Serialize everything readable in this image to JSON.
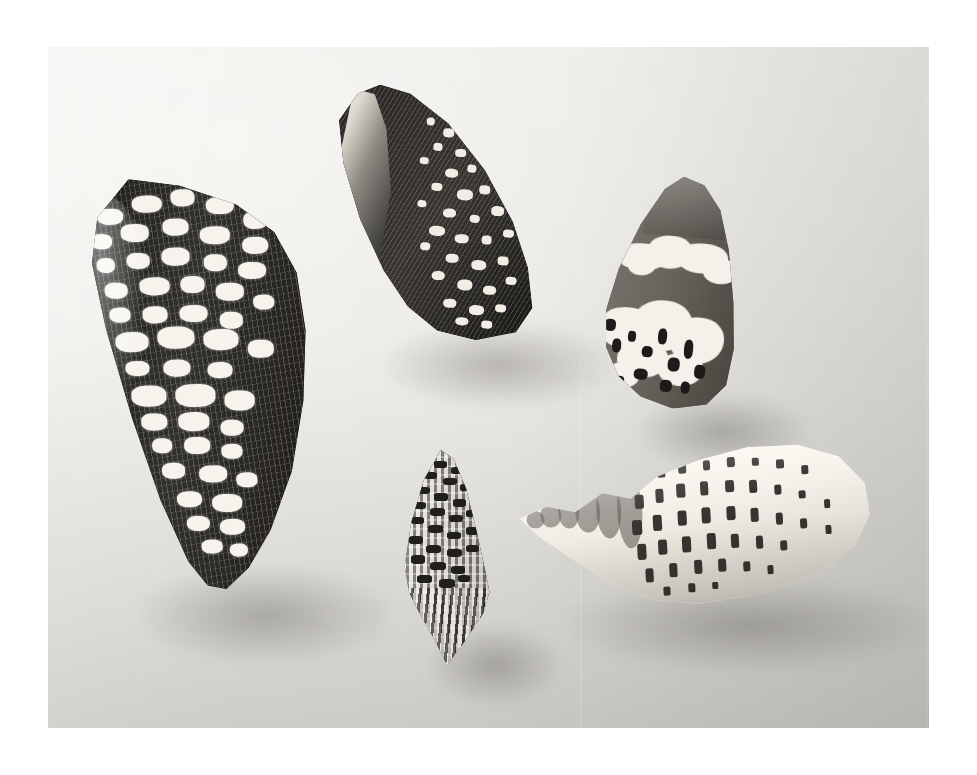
{
  "photograph": {
    "kind": "black-and-white-photograph",
    "subject": "five cone shells (Conidae) arranged on a plain light background",
    "orientation": "landscape",
    "border": {
      "color": "#ffffff",
      "left_px": 48,
      "top_px": 47,
      "right_px": 48,
      "bottom_px": 47
    },
    "print": {
      "width_px": 881,
      "height_px": 681,
      "background_color": "#e9e8e4",
      "highlight_color": "#f3f2ee",
      "shadow_color": "#d3d1cb",
      "lighting": "soft light from upper-left, shading toward lower-right"
    },
    "palette": {
      "paper_white": "#ffffff",
      "print_light": "#f3f2ee",
      "print_mid": "#e2e0db",
      "print_dark": "#d0cdc7",
      "shell_white": "#f1efe9",
      "shell_mid_gray": "#6e6b64",
      "shell_dark": "#211f1d",
      "shell_black": "#151413"
    }
  },
  "specimens": [
    {
      "id": "shell-textile",
      "label": "textile cone",
      "position": "upper left",
      "bbox": {
        "x": 80,
        "y": 177,
        "w": 232,
        "h": 413
      },
      "rotation_deg": -2,
      "view": "dorsal",
      "tone": "very dark brown-black ground",
      "pattern": "dense reticulated net of fine axial lines overlaid with rows of white triangular tent markings in broad spiral bands",
      "apex": "blunt, slightly eroded shoulder at upper left",
      "aperture_visible": false
    },
    {
      "id": "shell-aperture",
      "label": "cone shell, aperture view",
      "position": "top centre",
      "bbox": {
        "x": 330,
        "y": 88,
        "w": 218,
        "h": 250
      },
      "rotation_deg": 3,
      "view": "ventral / aperture",
      "tone": "dark ground with glossy pale outer lip",
      "pattern": "long narrow glossy aperture sweeping from apex to base, body mottled with small white flecks and coarse tented blotches near the base",
      "apex": "sharp, pointed toward upper left",
      "aperture_visible": true
    },
    {
      "id": "shell-cloud",
      "label": "cone shell with white cloud bands",
      "position": "right",
      "bbox": {
        "x": 596,
        "y": 176,
        "w": 150,
        "h": 232
      },
      "rotation_deg": 5,
      "view": "dorsal",
      "tone": "uniform medium gray body",
      "pattern": "two broad irregular chalk-white cloud-shaped bands, one across the upper third and a larger one across the base, with black scribble markings at the anterior end",
      "apex": "rounded, pointing up",
      "aperture_visible": false
    },
    {
      "id": "shell-spindle",
      "label": "small spindle-shaped shell",
      "position": "bottom centre",
      "bbox": {
        "x": 392,
        "y": 450,
        "w": 106,
        "h": 215
      },
      "rotation_deg": 0,
      "view": "dorsal",
      "tone": "pale ground with dark speckling",
      "pattern": "checkerboard of small dark squares arranged in spiral rows over a light ground; strongly ribbed toward the drawn-out anterior point",
      "apex": "low conical spire at top; long sharp siphonal point at bottom",
      "aperture_visible": false
    },
    {
      "id": "shell-pale",
      "label": "pale dashed cone",
      "position": "bottom right",
      "bbox": {
        "x": 520,
        "y": 436,
        "w": 350,
        "h": 175
      },
      "rotation_deg": -3,
      "view": "dorsal, lying on its side",
      "tone": "creamy white, almost unmarked ground",
      "pattern": "rows of short dark dashes and squarish spots in regular spiral bands; stepped, coronated spire",
      "apex": "stepped spire tapering to a fine point at the left",
      "aperture_visible": false
    }
  ],
  "composition": {
    "count": 5,
    "arrangement": "loose quincunx: large shell at left, one at top centre, one at right, one small at bottom centre, one lying horizontally at bottom right",
    "background": "flat seamless light studio backdrop with a faint vertical seam right of centre",
    "notes": "no text, labels, rulers or scale bars appear anywhere in the image"
  }
}
